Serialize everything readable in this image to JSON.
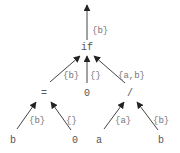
{
  "diagram": {
    "type": "expression-tree",
    "nodes": [
      {
        "id": "if",
        "label": "if",
        "x": 87,
        "y": 50
      },
      {
        "id": "eq",
        "label": "=",
        "x": 44,
        "y": 93
      },
      {
        "id": "zero_mid",
        "label": "0",
        "x": 87,
        "y": 93
      },
      {
        "id": "div",
        "label": "/",
        "x": 130,
        "y": 93
      },
      {
        "id": "b_left",
        "label": "b",
        "x": 13,
        "y": 140
      },
      {
        "id": "zero_left",
        "label": "0",
        "x": 75,
        "y": 140
      },
      {
        "id": "a",
        "label": "a",
        "x": 99,
        "y": 140
      },
      {
        "id": "b_right",
        "label": "b",
        "x": 161,
        "y": 140
      }
    ],
    "edges": [
      {
        "from": "if",
        "to": "root",
        "label": "{b}"
      },
      {
        "from": "eq",
        "to": "if",
        "label": "{b}"
      },
      {
        "from": "zero_mid",
        "to": "if",
        "label": "{}"
      },
      {
        "from": "div",
        "to": "if",
        "label": "{a,b}"
      },
      {
        "from": "b_left",
        "to": "eq",
        "label": "{b}"
      },
      {
        "from": "zero_left",
        "to": "eq",
        "label": "{}"
      },
      {
        "from": "a",
        "to": "div",
        "label": "{a}"
      },
      {
        "from": "b_right",
        "to": "div",
        "label": "{b}"
      }
    ]
  },
  "labels": {
    "root_edge": "{b}",
    "if": "if",
    "eq": "=",
    "zero_mid": "0",
    "div": "/",
    "b_left": "b",
    "zero_left": "0",
    "a": "a",
    "b_right": "b",
    "edge_eq_if": "{b}",
    "edge_zero_if": "{}",
    "edge_div_if": "{a,b}",
    "edge_b_eq": "{b}",
    "edge_zero_eq": "{}",
    "edge_a_div": "{a}",
    "edge_b_div": "{b}"
  },
  "colors": {
    "edge": "#444444",
    "node_text": "#555555",
    "label_text": "#777777",
    "background": "#ffffff"
  }
}
